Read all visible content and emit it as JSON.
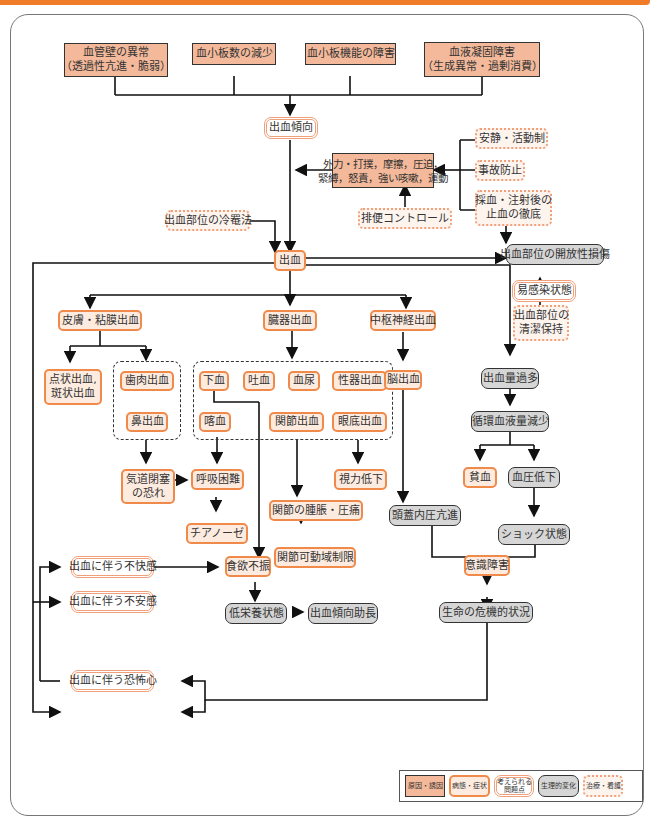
{
  "causes": {
    "vessel": "血管壁の異常\n（透過性亢進・脆弱）",
    "platelet_count": "血小板数の減少",
    "platelet_func": "血小板機能の障害",
    "coag": "血液凝固障害\n（生成異常・過剰消費）",
    "external": "外力・打撲，摩擦，圧迫，\n緊縛，怒責，強い咳嗽，運動"
  },
  "problems": {
    "tendency": "出血傾向",
    "infection": "易感染状態",
    "discomfort": "出血に伴う不快感",
    "anxiety": "出血に伴う不安感",
    "fear": "出血に伴う恐怖心"
  },
  "care": {
    "rest": "安静・活動制",
    "accident": "事故防止",
    "hemostasis": "採血・注射後の\n止血の徹底",
    "bowel": "排便コントロール",
    "cold": "出血部位の冷罨法",
    "clean": "出血部位の\n清潔保持"
  },
  "symptoms": {
    "bleeding": "出血",
    "skin": "皮膚・粘膜出血",
    "organ": "臓器出血",
    "cns": "中枢神経出血",
    "petechiae": "点状出血,\n斑状出血",
    "gum": "歯肉出血",
    "nose": "鼻出血",
    "melena": "下血",
    "hematemesis": "吐血",
    "hematuria": "血尿",
    "genital": "性器出血",
    "hemoptysis": "喀血",
    "joint": "関節出血",
    "fundus": "眼底出血",
    "brain": "脳出血",
    "airway": "気道閉塞\nの恐れ",
    "dyspnea": "呼吸困難",
    "cyanosis": "チアノーゼ",
    "vision": "視力低下",
    "swelling": "関節の腫脹・圧痛",
    "rom": "関節可動域制限",
    "anemia": "貧血",
    "appetite": "食欲不振",
    "consciousness": "意識障害"
  },
  "physio": {
    "wound": "出血部位の開放性損傷",
    "excess": "出血量過多",
    "volume": "循環血液量減少",
    "bp": "血圧低下",
    "icp": "頭蓋内圧亢進",
    "shock": "ショック状態",
    "malnutrition": "低栄養状態",
    "worsen": "出血傾向助長",
    "critical": "生命の危機的状況"
  },
  "legend": {
    "cause": "原因・誘因",
    "symptom": "病態・症状",
    "problem": "考えられる\n問題点",
    "physio": "生理的変化",
    "care": "治療・看護"
  }
}
